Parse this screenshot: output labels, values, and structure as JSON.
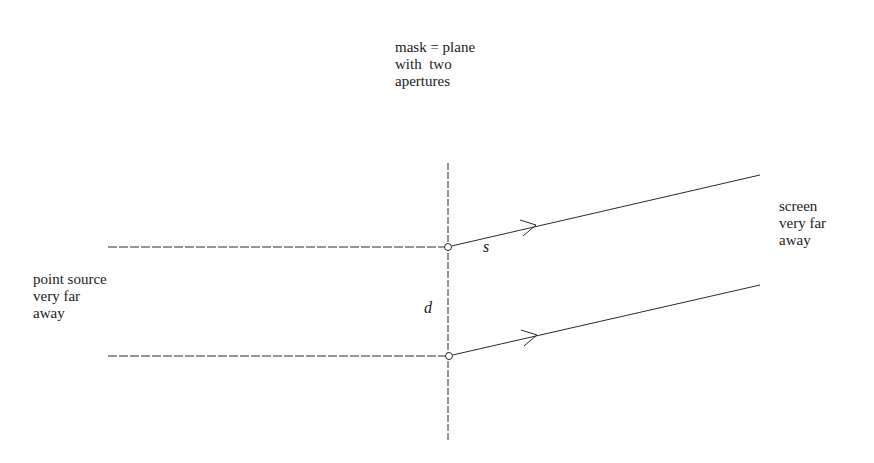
{
  "diagram": {
    "colors": {
      "ink": "#2a2a2a",
      "background": "#ffffff"
    },
    "labels": {
      "mask": {
        "lines": [
          "mask = plane",
          "with  two",
          "apertures"
        ]
      },
      "source": {
        "lines": [
          "point source",
          "very far",
          "away"
        ]
      },
      "screen": {
        "lines": [
          "screen",
          "very far",
          "away"
        ]
      }
    },
    "variables": {
      "separation": "d",
      "path": "s"
    },
    "elements": {
      "mask_line": {
        "style": "dashed",
        "x": 448,
        "y1": 163,
        "y2": 440
      },
      "incoming_rays": [
        {
          "style": "dashed",
          "x1": 108,
          "y": 247,
          "x2": 448
        },
        {
          "style": "dashed",
          "x1": 108,
          "y": 356,
          "x2": 448
        }
      ],
      "apertures": [
        {
          "cx": 448,
          "cy": 247,
          "r": 3.5
        },
        {
          "cx": 449,
          "cy": 356,
          "r": 3.5
        }
      ],
      "outgoing_rays": [
        {
          "x1": 451,
          "y1": 246,
          "x2": 760,
          "y2": 175,
          "arrow_at": [
            536,
            225
          ]
        },
        {
          "x1": 452,
          "y1": 355,
          "x2": 760,
          "y2": 285,
          "arrow_at": [
            537,
            335
          ]
        }
      ]
    }
  }
}
